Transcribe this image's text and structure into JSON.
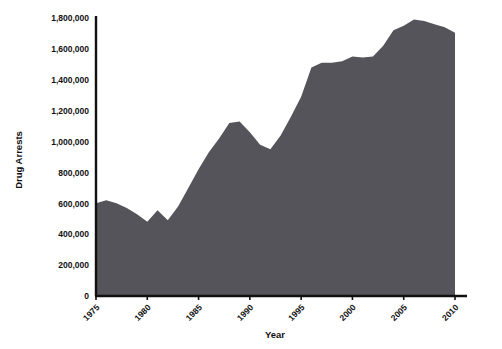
{
  "chart_data": {
    "type": "area",
    "title": "",
    "xlabel": "Year",
    "ylabel": "Drug Arrests",
    "xlim": [
      1975,
      2010
    ],
    "ylim": [
      0,
      1800000
    ],
    "grid": false,
    "legend": null,
    "series_color": "#54545a",
    "axis_color": "#101010",
    "background": "#ffffff",
    "x_ticks": [
      "1975",
      "1980",
      "1985",
      "1990",
      "1995",
      "2000",
      "2005",
      "2010"
    ],
    "x_tick_values": [
      1975,
      1980,
      1985,
      1990,
      1995,
      2000,
      2005,
      2010
    ],
    "y_ticks": [
      "0",
      "200,000",
      "400,000",
      "600,000",
      "800,000",
      "1,000,000",
      "1,200,000",
      "1,400,000",
      "1,600,000",
      "1,800,000"
    ],
    "y_tick_values": [
      0,
      200000,
      400000,
      600000,
      800000,
      1000000,
      1200000,
      1400000,
      1600000,
      1800000
    ],
    "x": [
      1975,
      1976,
      1977,
      1978,
      1979,
      1980,
      1981,
      1982,
      1983,
      1984,
      1985,
      1986,
      1987,
      1988,
      1989,
      1990,
      1991,
      1992,
      1993,
      1994,
      1995,
      1996,
      1997,
      1998,
      1999,
      2000,
      2001,
      2002,
      2003,
      2004,
      2005,
      2006,
      2007,
      2008,
      2009,
      2010
    ],
    "values": [
      600000,
      620000,
      600000,
      570000,
      530000,
      480000,
      555000,
      490000,
      580000,
      700000,
      820000,
      930000,
      1020000,
      1120000,
      1130000,
      1060000,
      980000,
      950000,
      1040000,
      1160000,
      1290000,
      1480000,
      1510000,
      1510000,
      1520000,
      1550000,
      1545000,
      1550000,
      1620000,
      1720000,
      1750000,
      1790000,
      1780000,
      1760000,
      1740000,
      1705000
    ]
  },
  "labels": {
    "y_axis_title": "Drug Arrests",
    "x_axis_title": "Year"
  }
}
